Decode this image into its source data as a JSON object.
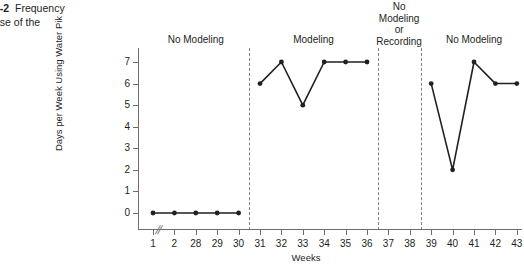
{
  "caption": {
    "number": "1-2",
    "line1_rest": "Frequency",
    "line2": "use of the"
  },
  "chart_data": {
    "type": "line",
    "title": "",
    "subtitle": "",
    "xlabel": "Weeks",
    "ylabel": "Days per Week Using Water Pik",
    "ylim": [
      0,
      7
    ],
    "yticks": [
      0,
      1,
      2,
      3,
      4,
      5,
      6,
      7
    ],
    "ytick_labels": [
      "0",
      "1",
      "2",
      "3",
      "4",
      "5",
      "6",
      "7"
    ],
    "xtick_labels": [
      "1",
      "2",
      "28",
      "29",
      "30",
      "31",
      "32",
      "33",
      "34",
      "35",
      "36",
      "37",
      "38",
      "39",
      "40",
      "41",
      "42",
      "43"
    ],
    "x_axis_break": {
      "present": true,
      "glyph": "//",
      "between": [
        "2",
        "28"
      ]
    },
    "grid": false,
    "legend": null,
    "series": [
      {
        "name": "Days per Week Using Water Pik",
        "marker": "filled-circle",
        "color": "#231f20",
        "segments": [
          {
            "phase": "No Modeling",
            "x": [
              "1",
              "2",
              "28",
              "29",
              "30"
            ],
            "values": [
              0,
              0,
              0,
              0,
              0
            ]
          },
          {
            "phase": "Modeling",
            "x": [
              "31",
              "32",
              "33",
              "34",
              "35",
              "36"
            ],
            "values": [
              6,
              7,
              5,
              7,
              7,
              7
            ]
          },
          {
            "phase": "No Modeling or Recording",
            "x": [
              "37",
              "38"
            ],
            "values": []
          },
          {
            "phase": "No Modeling",
            "x": [
              "39",
              "40",
              "41",
              "42",
              "43"
            ],
            "values": [
              6,
              2,
              7,
              6,
              6
            ]
          }
        ]
      }
    ],
    "phases": [
      {
        "label": "No Modeling",
        "start_x": "1",
        "end_x": "30"
      },
      {
        "label": "Modeling",
        "start_x": "31",
        "end_x": "36"
      },
      {
        "label": "No\nModeling\nor\nRecording",
        "start_x": "37",
        "end_x": "38"
      },
      {
        "label": "No Modeling",
        "start_x": "39",
        "end_x": "43"
      }
    ],
    "phase_dividers": [
      {
        "after_x": "30",
        "style": "dashed"
      },
      {
        "after_x": "36",
        "style": "dashed"
      },
      {
        "after_x": "38",
        "style": "dashed"
      }
    ],
    "annotations": []
  },
  "colors": {
    "data": "#231f20",
    "axis": "#6d6e71",
    "divider": "#808285",
    "background": "#ffffff"
  }
}
